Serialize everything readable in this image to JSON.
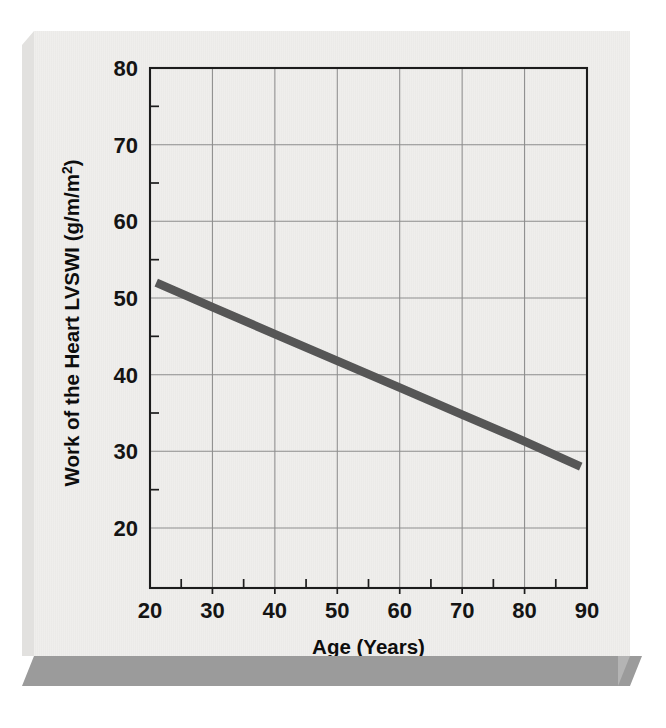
{
  "figure": {
    "background_color": "#efeeec",
    "panel_shadow_color": "#9b9b9b"
  },
  "chart_data": {
    "type": "line",
    "title": "",
    "subtitle": "",
    "xlabel": "Age (Years)",
    "ylabel": "Work of the Heart LVSWI (g/m/m",
    "ylabel_superscript": "2",
    "ylabel_suffix": ")",
    "xlim": [
      20,
      90
    ],
    "ylim": [
      16,
      80
    ],
    "x_major_ticks": [
      20,
      30,
      40,
      50,
      60,
      70,
      80,
      90
    ],
    "x_minor_ticks": [
      25,
      35,
      45,
      55,
      65,
      75,
      85
    ],
    "x_tick_labels": [
      "20",
      "30",
      "40",
      "50",
      "60",
      "70",
      "80",
      "90"
    ],
    "y_major_ticks": [
      20,
      30,
      40,
      50,
      60,
      70,
      80
    ],
    "y_minor_ticks": [
      25,
      35,
      45,
      55,
      65,
      75
    ],
    "y_tick_labels": [
      "20",
      "30",
      "40",
      "50",
      "60",
      "70",
      "80"
    ],
    "grid": true,
    "grid_color": "#8d8d8d",
    "legend": false,
    "legend_position": "none",
    "series": [
      {
        "name": "LVSWI regression",
        "color": "#565656",
        "line_width": 8.5,
        "x": [
          21,
          89
        ],
        "y": [
          52,
          28
        ],
        "points": [
          [
            21,
            52
          ],
          [
            30,
            48.8
          ],
          [
            40,
            45.3
          ],
          [
            50,
            41.8
          ],
          [
            60,
            38.3
          ],
          [
            70,
            34.8
          ],
          [
            80,
            31.3
          ],
          [
            89,
            28
          ]
        ]
      }
    ],
    "annotations": []
  }
}
